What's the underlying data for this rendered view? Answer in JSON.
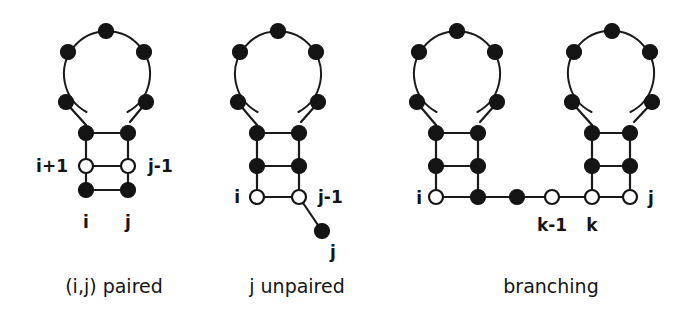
{
  "figure": {
    "background_color": "#ffffff",
    "ink_color": "#141414",
    "width": 694,
    "height": 326
  },
  "panels": [
    {
      "id": "panel-paired",
      "caption": "(i,j) paired",
      "caption_x": 114,
      "caption_y": 293,
      "labels": [
        {
          "name": "label-i-plus-1",
          "text": "i+1",
          "x": 68,
          "y": 172,
          "anchor": "end"
        },
        {
          "name": "label-j-minus-1",
          "text": "j-1",
          "x": 148,
          "y": 172,
          "anchor": "start"
        },
        {
          "name": "label-i",
          "text": "i",
          "x": 86,
          "y": 228,
          "anchor": "middle"
        },
        {
          "name": "label-j",
          "text": "j",
          "x": 128,
          "y": 228,
          "anchor": "middle"
        }
      ],
      "loop": {
        "cx": 106,
        "cy": 74,
        "r": 43,
        "node_count": 6
      },
      "stem": {
        "left_x": 86,
        "right_x": 128,
        "rows": [
          {
            "y": 133,
            "left": "filled",
            "right": "filled"
          },
          {
            "y": 166,
            "left": "open",
            "right": "open"
          },
          {
            "y": 190,
            "left": "filled",
            "right": "filled"
          }
        ]
      }
    },
    {
      "id": "panel-unpaired",
      "caption": "j unpaired",
      "caption_x": 297,
      "caption_y": 293,
      "labels": [
        {
          "name": "label-i",
          "text": "i",
          "x": 240,
          "y": 203,
          "anchor": "end"
        },
        {
          "name": "label-j-minus-1",
          "text": "j-1",
          "x": 318,
          "y": 203,
          "anchor": "start"
        },
        {
          "name": "label-j",
          "text": "j",
          "x": 330,
          "y": 258,
          "anchor": "start"
        }
      ],
      "loop": {
        "cx": 278,
        "cy": 74,
        "r": 43,
        "node_count": 6
      },
      "stem": {
        "left_x": 257,
        "right_x": 299,
        "rows": [
          {
            "y": 133,
            "left": "filled",
            "right": "filled"
          },
          {
            "y": 166,
            "left": "filled",
            "right": "filled"
          },
          {
            "y": 197,
            "left": "open",
            "right": "open"
          }
        ]
      },
      "dangling": {
        "x": 322,
        "y": 231,
        "style": "filled"
      }
    },
    {
      "id": "panel-branching",
      "caption": "branching",
      "caption_x": 551,
      "caption_y": 293,
      "labels": [
        {
          "name": "label-i",
          "text": "i",
          "x": 422,
          "y": 204,
          "anchor": "end"
        },
        {
          "name": "label-k-minus-1",
          "text": "k-1",
          "x": 552,
          "y": 231,
          "anchor": "middle"
        },
        {
          "name": "label-k",
          "text": "k",
          "x": 592,
          "y": 231,
          "anchor": "middle"
        },
        {
          "name": "label-j",
          "text": "j",
          "x": 648,
          "y": 204,
          "anchor": "start"
        }
      ],
      "loop_left": {
        "cx": 457,
        "cy": 74,
        "r": 43,
        "node_count": 6
      },
      "loop_right": {
        "cx": 612,
        "cy": 74,
        "r": 43,
        "node_count": 6
      },
      "stem_left": {
        "left_x": 436,
        "right_x": 478,
        "rows": [
          {
            "y": 133,
            "left": "filled",
            "right": "filled"
          },
          {
            "y": 166,
            "left": "filled",
            "right": "filled"
          }
        ]
      },
      "stem_right": {
        "left_x": 592,
        "right_x": 630,
        "rows": [
          {
            "y": 133,
            "left": "filled",
            "right": "filled"
          },
          {
            "y": 166,
            "left": "filled",
            "right": "filled"
          }
        ]
      },
      "backbone_y": 197,
      "backbone_nodes": [
        {
          "name": "node-i",
          "x": 436,
          "style": "open"
        },
        {
          "name": "node-after-left-stem",
          "x": 478,
          "style": "filled"
        },
        {
          "name": "node-chain-1",
          "x": 517,
          "style": "filled"
        },
        {
          "name": "node-k-minus-1",
          "x": 552,
          "style": "open"
        },
        {
          "name": "node-k",
          "x": 592,
          "style": "open"
        },
        {
          "name": "node-j",
          "x": 630,
          "style": "open"
        }
      ]
    }
  ]
}
